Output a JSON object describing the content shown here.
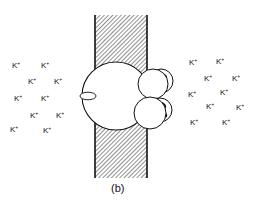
{
  "figure": {
    "caption": "(b)",
    "ion_label": "K",
    "ion_charge": "+",
    "colors": {
      "ink": "#111111",
      "hatch": "#555555",
      "background": "#ffffff"
    }
  },
  "ions_left": [
    {
      "x": 12,
      "y": 62
    },
    {
      "x": 41,
      "y": 62
    },
    {
      "x": 28,
      "y": 78
    },
    {
      "x": 54,
      "y": 78
    },
    {
      "x": 14,
      "y": 95
    },
    {
      "x": 41,
      "y": 95
    },
    {
      "x": 30,
      "y": 112
    },
    {
      "x": 56,
      "y": 112
    },
    {
      "x": 10,
      "y": 126
    },
    {
      "x": 43,
      "y": 127
    }
  ],
  "ions_right": [
    {
      "x": 189,
      "y": 59
    },
    {
      "x": 216,
      "y": 58
    },
    {
      "x": 204,
      "y": 75
    },
    {
      "x": 232,
      "y": 75
    },
    {
      "x": 188,
      "y": 91
    },
    {
      "x": 220,
      "y": 89
    },
    {
      "x": 206,
      "y": 103
    },
    {
      "x": 236,
      "y": 104
    },
    {
      "x": 190,
      "y": 119
    },
    {
      "x": 222,
      "y": 119
    }
  ]
}
